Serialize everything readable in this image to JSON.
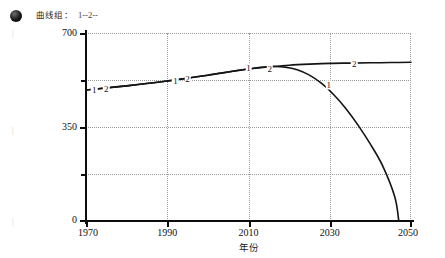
{
  "legend": {
    "marker_icon": "filled-circle-marker",
    "text": "曲线组：",
    "series_keys": "1--2--"
  },
  "margin_marks": [
    "|",
    "|",
    "|"
  ],
  "chart_data": {
    "type": "line",
    "title": "",
    "xlabel": "年份",
    "ylabel": "",
    "xlim": [
      1970,
      2050
    ],
    "ylim": [
      0,
      700
    ],
    "xticks": [
      1970,
      1990,
      2010,
      2030,
      2050
    ],
    "xtick_labels": [
      "1970",
      "1990",
      "2010",
      "2030",
      "2050"
    ],
    "yticks": [
      0,
      175,
      350,
      525,
      700
    ],
    "ytick_labels": [
      "0",
      "",
      "350",
      "",
      "700"
    ],
    "grid": true,
    "grid_style": "dotted",
    "legend_position": "top-left-outside",
    "series": [
      {
        "name": "1",
        "label": "1",
        "x": [
          1970,
          1975,
          1980,
          1985,
          1990,
          1995,
          2000,
          2005,
          2010,
          2013,
          2016,
          2019,
          2022,
          2025,
          2028,
          2031,
          2034,
          2037,
          2040,
          2043,
          2046,
          2047
        ],
        "values": [
          488,
          495,
          503,
          512,
          521,
          532,
          543,
          555,
          566,
          572,
          575,
          573,
          563,
          543,
          512,
          470,
          418,
          356,
          286,
          206,
          90,
          0
        ]
      },
      {
        "name": "2",
        "label": "2",
        "x": [
          1970,
          1980,
          1990,
          2000,
          2010,
          2016,
          2020,
          2025,
          2030,
          2035,
          2040,
          2045,
          2050
        ],
        "values": [
          488,
          503,
          521,
          543,
          566,
          575,
          580,
          584,
          587,
          588,
          589,
          590,
          591
        ]
      }
    ]
  }
}
